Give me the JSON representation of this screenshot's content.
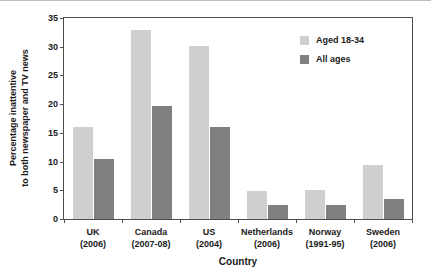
{
  "chart_data": {
    "type": "bar",
    "title": "",
    "xlabel": "Country",
    "ylabel_line1": "Percentage inattentive",
    "ylabel_line2": "to both newspaper and TV news",
    "categories": [
      {
        "name": "UK",
        "year": "(2006)"
      },
      {
        "name": "Canada",
        "year": "(2007-08)"
      },
      {
        "name": "US",
        "year": "(2004)"
      },
      {
        "name": "Netherlands",
        "year": "(2006)"
      },
      {
        "name": "Norway",
        "year": "(1991-95)"
      },
      {
        "name": "Sweden",
        "year": "(2006)"
      }
    ],
    "series": [
      {
        "name": "Aged 18-34",
        "color": "#cfcfcf",
        "values": [
          16.1,
          33.0,
          30.1,
          4.8,
          5.0,
          9.4
        ]
      },
      {
        "name": "All ages",
        "color": "#808080",
        "values": [
          10.5,
          19.7,
          16.1,
          2.5,
          2.5,
          3.5
        ]
      }
    ],
    "ylim": [
      0,
      35
    ],
    "yticks": [
      0,
      5,
      10,
      15,
      20,
      25,
      30,
      35
    ],
    "ytick_labels": [
      "0",
      "5",
      "10",
      "15",
      "20",
      "25",
      "30",
      "35"
    ],
    "grid": false,
    "legend_position": "top-right",
    "axis_color": "#4d4d4d",
    "background": "#ffffff"
  }
}
